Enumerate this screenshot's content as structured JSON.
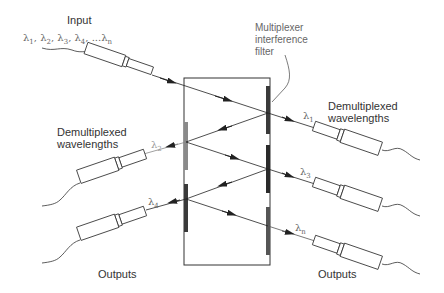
{
  "labels": {
    "input": "Input",
    "input_wavelengths": [
      "λ1",
      "λ2",
      "λ3",
      "λ4",
      "...λn"
    ],
    "filter_label": [
      "Multiplexer",
      "interference",
      "filter"
    ],
    "demux_right": [
      "Demultiplexed",
      "wavelengths"
    ],
    "demux_left": [
      "Demultiplexed",
      "wavelengths"
    ],
    "outputs_left": "Outputs",
    "outputs_right": "Outputs"
  },
  "wavelengths": {
    "l1": {
      "sym": "λ",
      "sub": "1"
    },
    "l2": {
      "sym": "λ",
      "sub": "2"
    },
    "l3": {
      "sym": "λ",
      "sub": "3"
    },
    "l4": {
      "sym": "λ",
      "sub": "4"
    },
    "ln": {
      "sym": "λ",
      "sub": "n"
    }
  },
  "colors": {
    "line": "#222222",
    "filter_dark": "#3a3a3a",
    "filter_light": "#8a8a8a"
  }
}
